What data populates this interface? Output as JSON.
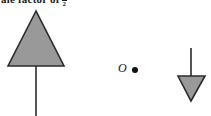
{
  "canvas": {
    "width": 211,
    "height": 116,
    "background": "#ffffff"
  },
  "caption": {
    "text": "ale factor of",
    "fraction_numerator": "1",
    "fraction_denominator": "2",
    "clipped": "true"
  },
  "figure": {
    "stroke_color": "#2b2b2b",
    "fill_color": "#999999",
    "shapes": {
      "preimage_triangle": {
        "label": "large-up-triangle",
        "apex_x": 36,
        "apex_y": 11,
        "base_y": 66,
        "left_x": 8,
        "right_x": 64,
        "points": "36,11 8,66 64,66"
      },
      "preimage_stem": {
        "label": "large-triangle-stem",
        "x": 36,
        "y_top": 66,
        "y_bottom": 116
      },
      "image_triangle": {
        "label": "small-down-triangle",
        "apex_x": 191,
        "apex_y": 101,
        "top_y": 76,
        "left_x": 178,
        "right_x": 205,
        "points": "178,76 205,76 191,101"
      },
      "image_stem": {
        "label": "small-triangle-stem",
        "x": 191,
        "y_top": 48,
        "y_bottom": 76
      },
      "center_point": {
        "label": "O",
        "dot_x": 135,
        "dot_y": 70,
        "dot_radius": 3
      }
    }
  }
}
